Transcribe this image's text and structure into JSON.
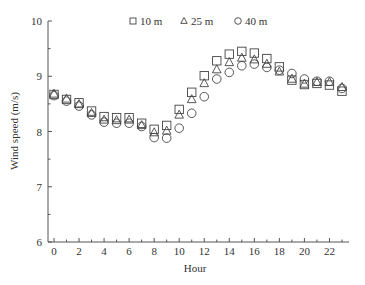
{
  "chart_data": {
    "type": "scatter",
    "title": "",
    "xlabel": "Hour",
    "ylabel": "Wind speed (m/s)",
    "xlim": [
      -0.5,
      23.6
    ],
    "ylim": [
      6,
      10
    ],
    "x_ticks_major": [
      0,
      2,
      4,
      6,
      8,
      10,
      12,
      14,
      16,
      18,
      20,
      22
    ],
    "x_ticks_minor": [
      1,
      3,
      5,
      7,
      9,
      11,
      13,
      15,
      17,
      19,
      21,
      23
    ],
    "y_ticks_major": [
      6,
      7,
      8,
      9,
      10
    ],
    "y_ticks_minor": [
      6.5,
      7.5,
      8.5,
      9.5
    ],
    "grid": false,
    "legend_position": "top-center",
    "x": [
      0,
      1,
      2,
      3,
      4,
      5,
      6,
      7,
      8,
      9,
      10,
      11,
      12,
      13,
      14,
      15,
      16,
      17,
      18,
      19,
      20,
      21,
      22,
      23
    ],
    "series": [
      {
        "name": "10 m",
        "marker": "square",
        "values": [
          8.67,
          8.58,
          8.52,
          8.37,
          8.27,
          8.25,
          8.25,
          8.15,
          8.04,
          8.11,
          8.4,
          8.71,
          9.01,
          9.28,
          9.4,
          9.45,
          9.42,
          9.32,
          9.17,
          8.93,
          8.85,
          8.87,
          8.84,
          8.73
        ]
      },
      {
        "name": "25 m",
        "marker": "triangle",
        "values": [
          8.68,
          8.59,
          8.49,
          8.33,
          8.21,
          8.2,
          8.21,
          8.11,
          7.98,
          8.01,
          8.3,
          8.58,
          8.87,
          9.12,
          9.25,
          9.33,
          9.3,
          9.22,
          9.08,
          8.95,
          8.86,
          8.89,
          8.89,
          8.8
        ]
      },
      {
        "name": "40 m",
        "marker": "circle",
        "values": [
          8.65,
          8.55,
          8.46,
          8.3,
          8.17,
          8.15,
          8.15,
          8.09,
          7.89,
          7.88,
          8.06,
          8.33,
          8.63,
          8.95,
          9.07,
          9.19,
          9.22,
          9.16,
          9.11,
          9.05,
          8.95,
          8.91,
          8.91,
          8.78
        ]
      }
    ]
  },
  "colors": {
    "axis": "#555555",
    "marker_stroke": "#444444",
    "text": "#333333",
    "background": "#ffffff"
  }
}
